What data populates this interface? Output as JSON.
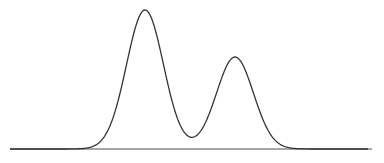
{
  "chart_data": {
    "type": "line",
    "title": "",
    "xlabel": "",
    "ylabel": "",
    "grid": false,
    "legend": null,
    "series": [
      {
        "name": "density",
        "components": [
          {
            "center_px": 145,
            "peak_y_px": 10,
            "sigma_px": 18.5
          },
          {
            "center_px": 235,
            "peak_y_px": 57,
            "sigma_px": 18.5
          }
        ],
        "peaks": [
          {
            "x_px": 145,
            "relative_height": 1.0
          },
          {
            "x_px": 235,
            "relative_height": 0.66
          }
        ],
        "valley": {
          "x_px": 193,
          "relative_height": 0.22
        }
      }
    ],
    "baseline": {
      "y_px": 149,
      "x_start_px": 10,
      "x_end_px": 372
    },
    "colors": {
      "curve": "#333333",
      "baseline": "#888888",
      "background": "#ffffff"
    }
  }
}
